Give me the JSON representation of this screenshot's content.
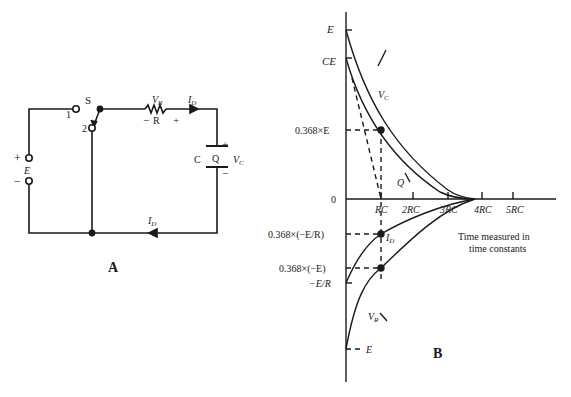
{
  "panel_a": {
    "label": "A",
    "switch_label": "S",
    "switch_pos1": "1",
    "switch_pos2": "2",
    "source_label": "E",
    "source_plus": "+",
    "source_minus": "−",
    "resistor_label": "R",
    "resistor_voltage": "V",
    "resistor_voltage_sub": "R",
    "resistor_minus": "−",
    "resistor_plus": "+",
    "current_top": "I",
    "current_top_sub": "D",
    "current_bottom": "I",
    "current_bottom_sub": "D",
    "capacitor_label": "C",
    "capacitor_charge": "Q",
    "capacitor_voltage": "V",
    "capacitor_voltage_sub": "C",
    "capacitor_plus": "+",
    "capacitor_minus": "−"
  },
  "panel_b": {
    "label": "B",
    "y_labels": {
      "e": "E",
      "ce": "CE",
      "e368": "0.368×E",
      "zero": "0",
      "ier368": "0.368×(−E/R)",
      "ie368": "0.368×(−E)",
      "neg_er": "−E/R",
      "neg_e": "E"
    },
    "x_ticks": [
      "RC",
      "2RC",
      "3RC",
      "4RC",
      "5RC"
    ],
    "x_note_line1": "Time measured in",
    "x_note_line2": "time constants",
    "curve_vc": "V",
    "curve_vc_sub": "C",
    "curve_q": "Q",
    "curve_id": "I",
    "curve_id_sub": "D",
    "curve_vr": "V",
    "curve_vr_sub": "R"
  }
}
